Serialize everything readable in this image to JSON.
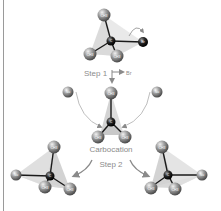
{
  "diagram": {
    "colors": {
      "atom": "#8a8a8a",
      "carbon": "#1c1c1c",
      "bond": "#1a1a1a",
      "tetrahedron": "#d0d0d0",
      "arrow": "#888888",
      "text": "#8c8c8c",
      "frame_line": "#9a9a9a"
    },
    "reactant": {
      "atoms": [
        "CH3",
        "CH3",
        "CH3",
        "C",
        "Br"
      ]
    },
    "step1": {
      "label": "Step 1",
      "leaving_group": "Br"
    },
    "intermediate": {
      "label": "Carbocation",
      "atoms": [
        "CH3",
        "CH3",
        "CH3",
        "C"
      ],
      "nucleophiles": [
        "Nu",
        "Nu"
      ]
    },
    "step2": {
      "label": "Step 2"
    },
    "products": [
      {
        "name": "left-product",
        "atoms": [
          "CH3",
          "CH3",
          "CH3",
          "C",
          "Nu"
        ]
      },
      {
        "name": "right-product",
        "atoms": [
          "CH3",
          "CH3",
          "CH3",
          "C",
          "Nu"
        ]
      }
    ]
  }
}
